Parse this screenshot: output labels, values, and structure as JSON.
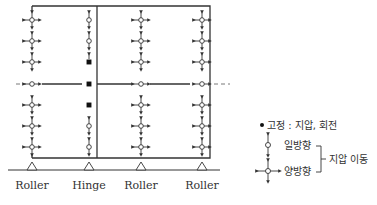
{
  "diagram": {
    "colors": {
      "line": "#333333",
      "node_fill": "#ffffff",
      "fixed": "#111111",
      "background": "#ffffff"
    },
    "supports": [
      {
        "x": 32,
        "label": "Roller"
      },
      {
        "x": 89,
        "label": "Hinge"
      },
      {
        "x": 141,
        "label": "Roller"
      },
      {
        "x": 202,
        "label": "Roller"
      }
    ],
    "legend": {
      "fixed_label": "고정 : 지압, 회전",
      "one_way_label": "일방향",
      "two_way_label": "양방향",
      "bracket_label": "지압 이동"
    }
  }
}
